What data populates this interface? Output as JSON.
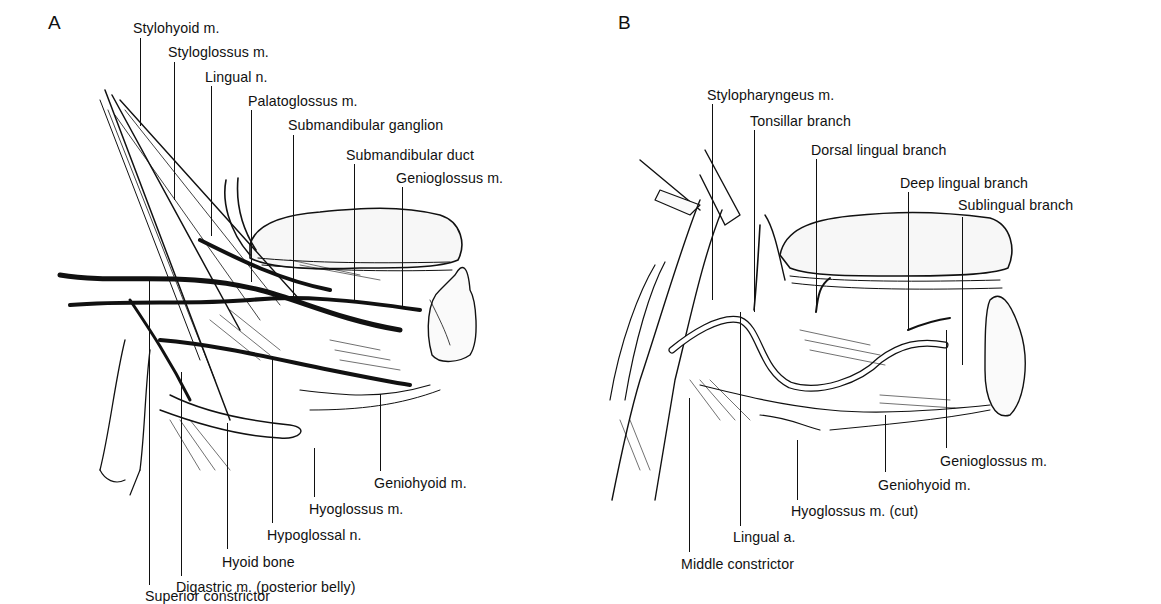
{
  "figure": {
    "panels": [
      {
        "letter": "A",
        "labels": [
          {
            "text": "Stylohyoid m.",
            "x": 133,
            "y": 20,
            "line_x": 140,
            "line_top": 38,
            "line_bottom": 126
          },
          {
            "text": "Styloglossus m.",
            "x": 168,
            "y": 44,
            "line_x": 174,
            "line_top": 62,
            "line_bottom": 200
          },
          {
            "text": "Lingual n.",
            "x": 205,
            "y": 69,
            "line_x": 211,
            "line_top": 86,
            "line_bottom": 236
          },
          {
            "text": "Palatoglossus m.",
            "x": 248,
            "y": 93,
            "line_x": 251,
            "line_top": 110,
            "line_bottom": 282
          },
          {
            "text": "Submandibular ganglion",
            "x": 288,
            "y": 117,
            "line_x": 293,
            "line_top": 135,
            "line_bottom": 298
          },
          {
            "text": "Submandibular duct",
            "x": 346,
            "y": 147,
            "line_x": 354,
            "line_top": 164,
            "line_bottom": 300
          },
          {
            "text": "Genioglossus m.",
            "x": 396,
            "y": 170,
            "line_x": 402,
            "line_top": 187,
            "line_bottom": 306
          },
          {
            "text": "Geniohyoid m.",
            "x": 374,
            "y": 475,
            "line_x": 380,
            "line_top": 394,
            "line_bottom": 471
          },
          {
            "text": "Hyoglossus m.",
            "x": 309,
            "y": 501,
            "line_x": 314,
            "line_top": 448,
            "line_bottom": 497
          },
          {
            "text": "Hypoglossal n.",
            "x": 267,
            "y": 527,
            "line_x": 272,
            "line_top": 357,
            "line_bottom": 523
          },
          {
            "text": "Hyoid bone",
            "x": 222,
            "y": 554,
            "line_x": 227,
            "line_top": 423,
            "line_bottom": 549
          },
          {
            "text": "Digastric m. (posterior belly)",
            "x": 176,
            "y": 579,
            "line_x": 181,
            "line_top": 372,
            "line_bottom": 576
          },
          {
            "text": "Superior constrictor",
            "x": 145,
            "y": 609,
            "line_x": 149,
            "line_top": 280,
            "line_bottom": 605
          }
        ]
      },
      {
        "letter": "B",
        "labels": [
          {
            "text": "Stylopharyngeus m.",
            "x": 707,
            "y": 87,
            "line_x": 712,
            "line_top": 104,
            "line_bottom": 300
          },
          {
            "text": "Tonsillar branch",
            "x": 750,
            "y": 113,
            "line_x": 754,
            "line_top": 130,
            "line_bottom": 312
          },
          {
            "text": "Dorsal lingual branch",
            "x": 811,
            "y": 142,
            "line_x": 816,
            "line_top": 159,
            "line_bottom": 312
          },
          {
            "text": "Deep lingual branch",
            "x": 900,
            "y": 175,
            "line_x": 908,
            "line_top": 192,
            "line_bottom": 330
          },
          {
            "text": "Sublingual branch",
            "x": 958,
            "y": 197,
            "line_x": 962,
            "line_top": 217,
            "line_bottom": 365
          },
          {
            "text": "Genioglossus m.",
            "x": 940,
            "y": 453,
            "line_x": 946,
            "line_top": 330,
            "line_bottom": 448
          },
          {
            "text": "Geniohyoid m.",
            "x": 878,
            "y": 477,
            "line_x": 885,
            "line_top": 415,
            "line_bottom": 472
          },
          {
            "text": "Hyoglossus m. (cut)",
            "x": 791,
            "y": 503,
            "line_x": 797,
            "line_top": 440,
            "line_bottom": 500
          },
          {
            "text": "Lingual a.",
            "x": 733,
            "y": 529,
            "line_x": 740,
            "line_top": 312,
            "line_bottom": 526
          },
          {
            "text": "Middle constrictor",
            "x": 681,
            "y": 556,
            "line_x": 689,
            "line_top": 398,
            "line_bottom": 552
          }
        ]
      }
    ]
  }
}
